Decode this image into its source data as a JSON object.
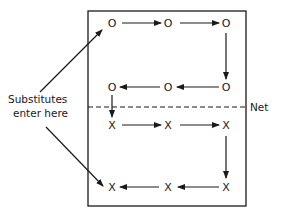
{
  "diagram": {
    "label_substitutes_line1": "Substitutes",
    "label_substitutes_line2": "enter here",
    "label_net": "Net",
    "rows": [
      {
        "name": "top-row",
        "nodes": [
          "O",
          "O",
          "O"
        ],
        "direction": "left-to-right"
      },
      {
        "name": "second-row",
        "nodes": [
          "O",
          "O",
          "O"
        ],
        "direction": "right-to-left"
      },
      {
        "name": "third-row",
        "nodes": [
          "X",
          "X",
          "X"
        ],
        "direction": "left-to-right"
      },
      {
        "name": "bottom-row",
        "nodes": [
          "X",
          "X",
          "X"
        ],
        "direction": "right-to-left"
      }
    ]
  }
}
